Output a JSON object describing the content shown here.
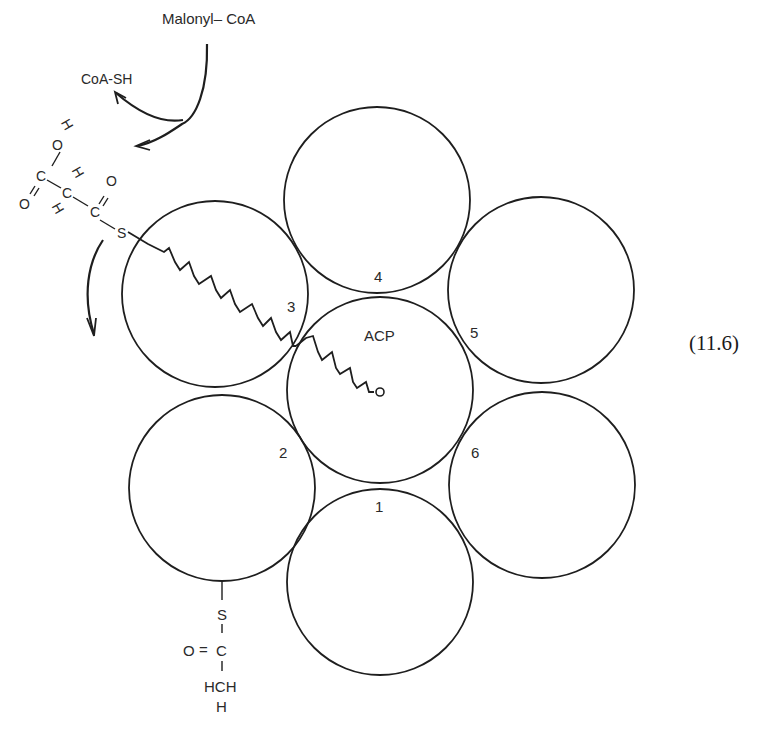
{
  "figure": {
    "equation_number": "(11.6)",
    "reagents": {
      "malonyl_coa": "Malonyl– CoA",
      "coa_sh": "CoA-SH"
    },
    "center_label": "ACP",
    "subunit_labels": [
      "1",
      "2",
      "3",
      "4",
      "5",
      "6"
    ],
    "malonyl_group": {
      "atoms": [
        "H",
        "O",
        "C",
        "O",
        "H",
        "C",
        "H",
        "C",
        "O",
        "S"
      ]
    },
    "acetyl_group": {
      "atoms": [
        "S",
        "O",
        "C",
        "HCH",
        "H"
      ],
      "bond_double": "="
    }
  }
}
